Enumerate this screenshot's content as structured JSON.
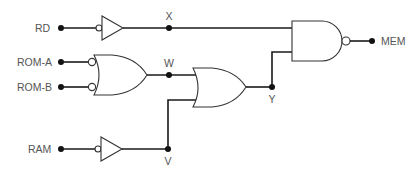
{
  "diagram": {
    "type": "logic-circuit",
    "inputs": {
      "rd": "RD",
      "rom_a": "ROM-A",
      "rom_b": "ROM-B",
      "ram": "RAM"
    },
    "output": "MEM",
    "nodes": {
      "x": "X",
      "w": "W",
      "y": "Y",
      "v": "V"
    },
    "gates": [
      {
        "id": "buffer-rd",
        "kind": "buffer",
        "inverted_input": true,
        "inputs": [
          "RD"
        ],
        "output": "X"
      },
      {
        "id": "or-rom",
        "kind": "or",
        "inverted_inputs": true,
        "inputs": [
          "ROM-A",
          "ROM-B"
        ],
        "output": "W"
      },
      {
        "id": "buffer-ram",
        "kind": "buffer",
        "inverted_input": true,
        "inputs": [
          "RAM"
        ],
        "output": "V"
      },
      {
        "id": "or-wv",
        "kind": "or",
        "inverted_inputs": false,
        "inputs": [
          "W",
          "V"
        ],
        "output": "Y"
      },
      {
        "id": "nand-mem",
        "kind": "nand",
        "inputs": [
          "X",
          "Y"
        ],
        "output": "MEM"
      }
    ],
    "colors": {
      "wire": "#1a1a1a",
      "gate_outline": "#333333",
      "label": "#555555"
    }
  }
}
